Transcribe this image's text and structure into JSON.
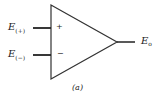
{
  "diagram": {
    "type": "op-amp-symbol",
    "inputs": [
      {
        "name": "E",
        "subscript": "(+)",
        "sign": "+"
      },
      {
        "name": "E",
        "subscript": "(−)",
        "sign": "−"
      }
    ],
    "output": {
      "name": "E",
      "subscript": "o"
    },
    "caption": "(a)",
    "stroke_color": "#333333"
  }
}
